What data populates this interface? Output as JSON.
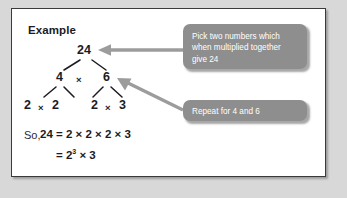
{
  "figure": {
    "heading": "Example",
    "frame_border_color": "#3a3a3c",
    "page_background": "#d8d8d8",
    "card_background": "#ffffff"
  },
  "factor_tree": {
    "root": "24",
    "level_2": {
      "left": "4",
      "operator": "×",
      "right": "6"
    },
    "level_3": {
      "left_pair": {
        "a": "2",
        "operator": "×",
        "b": "2"
      },
      "right_pair": {
        "a": "2",
        "operator": "×",
        "b": "3"
      }
    }
  },
  "conclusion": {
    "prefix": "So,",
    "line_1": "24 = 2 × 2 × 2 × 3",
    "line_2_prefix": "= 2",
    "line_2_exponent": "3",
    "line_2_suffix": " × 3"
  },
  "callouts": [
    {
      "id": "callout-give-24",
      "color": "#8e8e8e",
      "text_color": "#ffffff",
      "lines": [
        "Pick two numbers which",
        "when multiplied together",
        "give 24"
      ]
    },
    {
      "id": "callout-repeat",
      "color": "#8e8e8e",
      "text_color": "#ffffff",
      "lines": [
        "Repeat for 4 and 6"
      ]
    }
  ],
  "arrows": [
    {
      "name": "arrow-to-root",
      "color": "#9a9a9a",
      "direction": "left",
      "points_to": "24"
    },
    {
      "name": "arrow-to-six",
      "color": "#9a9a9a",
      "direction": "up-left",
      "points_to": "6"
    }
  ],
  "tree_edges": {
    "color": "#1b1b23",
    "count": 6
  }
}
